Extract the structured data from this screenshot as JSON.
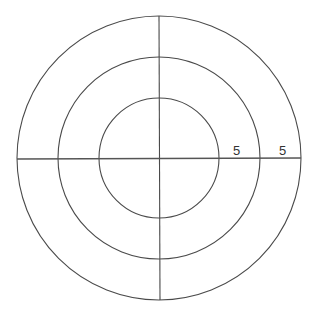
{
  "diagram": {
    "type": "concentric-circles-with-axes",
    "center": [
      159,
      158
    ],
    "rings": [
      {
        "name": "inner",
        "radius": 60
      },
      {
        "name": "middle",
        "radius": 101
      },
      {
        "name": "outer",
        "radius": 142
      }
    ],
    "labels": [
      {
        "text": "5",
        "x": 237,
        "y": 156
      },
      {
        "text": "5",
        "x": 283,
        "y": 156
      }
    ],
    "colors": {
      "stroke": "#4a4a4a",
      "background": "#ffffff"
    }
  }
}
